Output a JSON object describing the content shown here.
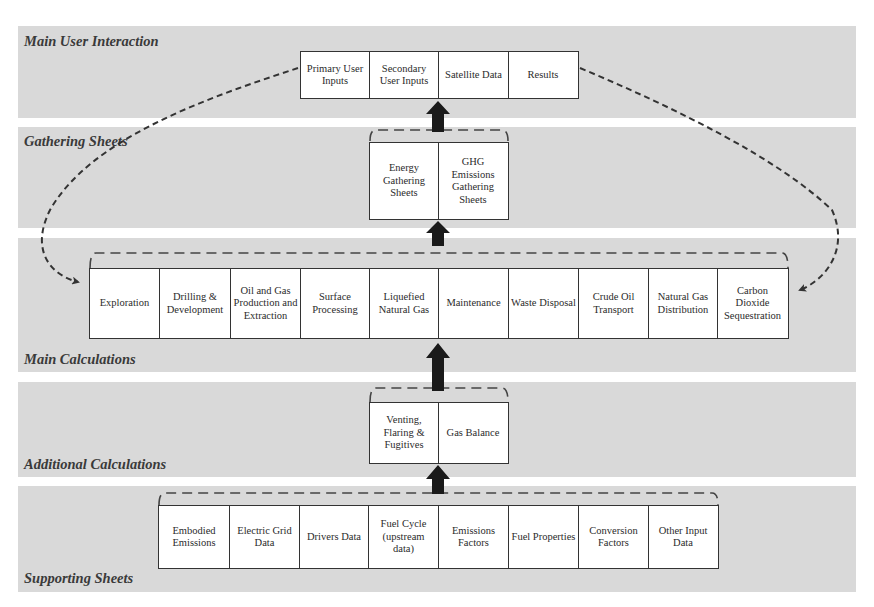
{
  "bands": [
    {
      "id": "main-user-interaction",
      "label": "Main User Interaction"
    },
    {
      "id": "gathering-sheets",
      "label": "Gathering Sheets"
    },
    {
      "id": "main-calculations",
      "label": "Main Calculations"
    },
    {
      "id": "additional-calculations",
      "label": "Additional Calculations"
    },
    {
      "id": "supporting-sheets",
      "label": "Supporting Sheets"
    }
  ],
  "main_user_interaction": {
    "boxes": [
      "Primary User Inputs",
      "Secondary User Inputs",
      "Satellite Data",
      "Results"
    ]
  },
  "gathering_sheets": {
    "boxes": [
      "Energy Gathering Sheets",
      "GHG Emissions Gathering Sheets"
    ]
  },
  "main_calculations": {
    "boxes": [
      "Exploration",
      "Drilling & Development",
      "Oil and Gas Production and Extraction",
      "Surface Processing",
      "Liquefied Natural Gas",
      "Maintenance",
      "Waste Disposal",
      "Crude Oil Transport",
      "Natural Gas Distribution",
      "Carbon Dioxide Sequestration"
    ]
  },
  "additional_calculations": {
    "boxes": [
      "Venting, Flaring & Fugitives",
      "Gas Balance"
    ]
  },
  "supporting_sheets": {
    "boxes": [
      "Embodied Emissions",
      "Electric Grid Data",
      "Drivers Data",
      "Fuel Cycle (upstream data)",
      "Emissions Factors",
      "Fuel Properties",
      "Conversion Factors",
      "Other Input Data"
    ]
  },
  "connectors": {
    "solid_arrows": [
      "supporting-to-additional",
      "additional-to-main",
      "main-to-gathering",
      "gathering-to-user-interaction"
    ],
    "dashed_curves": [
      "primary-user-inputs-to-main-calculations",
      "results-to-main-calculations"
    ]
  },
  "colors": {
    "band_fill": "#d9d9d9",
    "box_fill": "#ffffff",
    "line": "#333333",
    "arrow": "#1a1a1a"
  }
}
